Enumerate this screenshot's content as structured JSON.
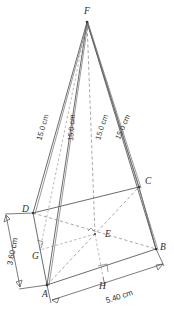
{
  "figure": {
    "type": "geometry-diagram",
    "background_color": "#ffffff",
    "line_color": "#5a5a5a",
    "hidden_line_color": "#8a8a8a"
  },
  "vertices": [
    {
      "id": "F",
      "label": "F",
      "role": "apex",
      "x": 87,
      "y": 22,
      "label_x": 84,
      "label_y": 14
    },
    {
      "id": "D",
      "label": "D",
      "role": "base-corner",
      "x": 33,
      "y": 213,
      "label_x": 22,
      "label_y": 212
    },
    {
      "id": "C",
      "label": "C",
      "role": "base-corner",
      "x": 139,
      "y": 187,
      "label_x": 145,
      "label_y": 184
    },
    {
      "id": "A",
      "label": "A",
      "role": "base-corner",
      "x": 47,
      "y": 285,
      "label_x": 42,
      "label_y": 297
    },
    {
      "id": "B",
      "label": "B",
      "role": "base-corner",
      "x": 156,
      "y": 249,
      "label_x": 160,
      "label_y": 250
    },
    {
      "id": "E",
      "label": "E",
      "role": "base-centre",
      "x": 95,
      "y": 234,
      "label_x": 105,
      "label_y": 236
    },
    {
      "id": "G",
      "label": "G",
      "role": "foot-on-AD",
      "x": 40,
      "y": 250,
      "label_x": 33,
      "label_y": 258
    },
    {
      "id": "H",
      "label": "H",
      "role": "foot-on-AB",
      "x": 103,
      "y": 277,
      "label_x": 100,
      "label_y": 288
    }
  ],
  "edges": {
    "solid": [
      {
        "name": "F-D",
        "from": "F",
        "to": "D"
      },
      {
        "name": "F-A",
        "from": "F",
        "to": "A"
      },
      {
        "name": "F-C",
        "from": "F",
        "to": "C"
      },
      {
        "name": "F-B",
        "from": "F",
        "to": "B"
      },
      {
        "name": "D-C",
        "from": "D",
        "to": "C"
      },
      {
        "name": "D-A",
        "from": "D",
        "to": "A"
      },
      {
        "name": "C-B",
        "from": "C",
        "to": "B"
      },
      {
        "name": "A-B",
        "from": "A",
        "to": "B"
      }
    ],
    "hidden": [
      {
        "name": "F-E-altitude",
        "from": "F",
        "to": "E"
      },
      {
        "name": "E-H-projection",
        "from": "E",
        "to": "H"
      },
      {
        "name": "F-G",
        "from": "F",
        "to": "G"
      },
      {
        "name": "D-B-diagonal",
        "from": "D",
        "to": "B"
      },
      {
        "name": "A-C-diagonal",
        "from": "A",
        "to": "C"
      },
      {
        "name": "E-A",
        "from": "E",
        "to": "A"
      },
      {
        "name": "E-G",
        "from": "E",
        "to": "G"
      }
    ]
  },
  "edge_labels": [
    {
      "name": "label-FD",
      "text": "15.0 cm",
      "x": 45,
      "y": 128,
      "rotation": -74
    },
    {
      "name": "label-FA",
      "text": "15.0 cm",
      "x": 74,
      "y": 128,
      "rotation": -86
    },
    {
      "name": "label-FC",
      "text": "15.0 cm",
      "x": 104,
      "y": 128,
      "rotation": -72
    },
    {
      "name": "label-FB",
      "text": "15.0 cm",
      "x": 125,
      "y": 128,
      "rotation": -66
    }
  ],
  "dimensions": [
    {
      "name": "dimension-width-AD",
      "text": "3.60 cm",
      "value": 3.6,
      "unit": "cm",
      "measures": "A-D",
      "label_x": 15,
      "label_y": 255,
      "rotation": -79
    },
    {
      "name": "dimension-length-AB",
      "text": "5.40 cm",
      "value": 5.4,
      "unit": "cm",
      "measures": "A-B",
      "label_x": 118,
      "label_y": 300,
      "rotation": -18
    }
  ],
  "slant_edge_length": {
    "value": 15.0,
    "unit": "cm",
    "text": "15.0 cm"
  },
  "right_angles": [
    {
      "name": "right-angle-at-E",
      "at": "E"
    },
    {
      "name": "right-angle-at-H",
      "at": "H"
    },
    {
      "name": "right-angle-at-G",
      "at": "G"
    }
  ]
}
